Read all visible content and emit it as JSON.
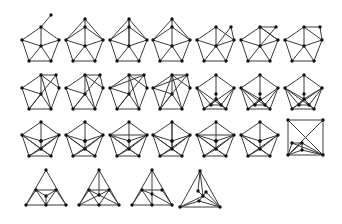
{
  "figure": {
    "rows": 4,
    "graphs": [
      {
        "id": "g1",
        "row": 0,
        "col": 0,
        "base": "pentagon",
        "variant": "pendant"
      },
      {
        "id": "g2",
        "row": 0,
        "col": 1,
        "base": "pentagon",
        "variant": "double-apex"
      },
      {
        "id": "g3",
        "row": 0,
        "col": 2,
        "base": "pentagon",
        "variant": "apex-fan"
      },
      {
        "id": "g4",
        "row": 0,
        "col": 3,
        "base": "pentagon",
        "variant": "apex-chord"
      },
      {
        "id": "g5",
        "row": 0,
        "col": 4,
        "base": "pentagon",
        "variant": "extra-top-right"
      },
      {
        "id": "g6",
        "row": 0,
        "col": 5,
        "base": "pentagon",
        "variant": "cross-top"
      },
      {
        "id": "g7",
        "row": 0,
        "col": 6,
        "base": "pentagon",
        "variant": "top-edge"
      },
      {
        "id": "g8",
        "row": 1,
        "col": 0,
        "base": "pentagon",
        "variant": "cross-a"
      },
      {
        "id": "g9",
        "row": 1,
        "col": 1,
        "base": "pentagon",
        "variant": "cross-b"
      },
      {
        "id": "g10",
        "row": 1,
        "col": 2,
        "base": "pentagon",
        "variant": "cross-c"
      },
      {
        "id": "g11",
        "row": 1,
        "col": 3,
        "base": "pentagon",
        "variant": "cross-d"
      },
      {
        "id": "g12",
        "row": 1,
        "col": 4,
        "base": "pentagon",
        "variant": "inner-square"
      },
      {
        "id": "g13",
        "row": 1,
        "col": 5,
        "base": "pentagon",
        "variant": "inner-triangle"
      },
      {
        "id": "g14",
        "row": 1,
        "col": 6,
        "base": "pentagon",
        "variant": "inner-triangle-b"
      },
      {
        "id": "g15",
        "row": 2,
        "col": 0,
        "base": "pentagon",
        "variant": "inner-pair-a"
      },
      {
        "id": "g16",
        "row": 2,
        "col": 1,
        "base": "pentagon",
        "variant": "inner-pair-b"
      },
      {
        "id": "g17",
        "row": 2,
        "col": 2,
        "base": "pentagon",
        "variant": "inner-pair-c"
      },
      {
        "id": "g18",
        "row": 2,
        "col": 3,
        "base": "pentagon",
        "variant": "inner-pair-d"
      },
      {
        "id": "g19",
        "row": 2,
        "col": 4,
        "base": "pentagon",
        "variant": "inner-pair-e"
      },
      {
        "id": "g20",
        "row": 2,
        "col": 5,
        "base": "pentagon",
        "variant": "inner-pair-f"
      },
      {
        "id": "g21",
        "row": 2,
        "col": 6,
        "base": "square",
        "variant": "diagonals-inner"
      },
      {
        "id": "g22",
        "row": 3,
        "col": 0,
        "base": "triangle",
        "variant": "inner-triangle"
      },
      {
        "id": "g23",
        "row": 3,
        "col": 1,
        "base": "triangle",
        "variant": "inner-center-vertical"
      },
      {
        "id": "g24",
        "row": 3,
        "col": 2,
        "base": "triangle",
        "variant": "inner-center-b"
      },
      {
        "id": "g25",
        "row": 3,
        "col": 3,
        "base": "triangle",
        "variant": "inner-cluster"
      }
    ]
  }
}
